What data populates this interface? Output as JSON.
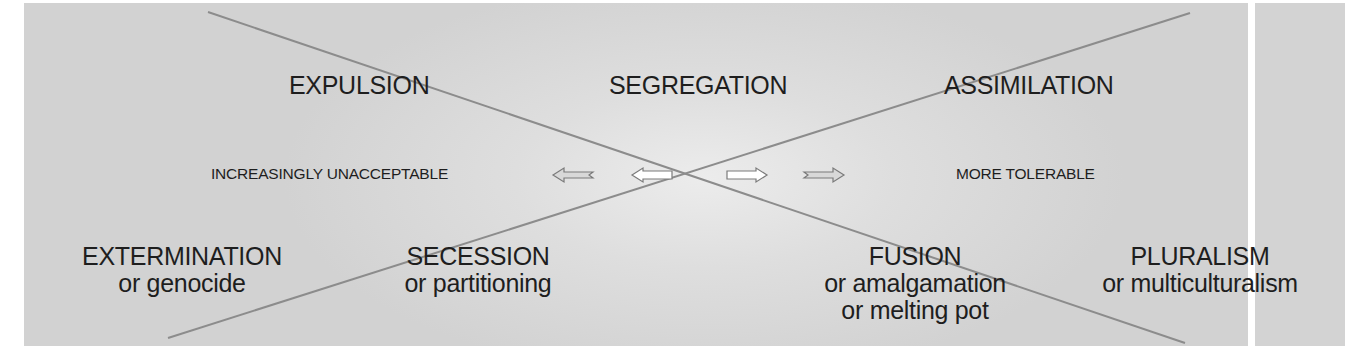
{
  "diagram": {
    "top_row": {
      "expulsion": "EXPULSION",
      "segregation": "SEGREGATION",
      "assimilation": "ASSIMILATION"
    },
    "middle_row": {
      "left_label": "INCREASINGLY UNACCEPTABLE",
      "right_label": "MORE TOLERABLE",
      "arrows": [
        {
          "direction": "left",
          "style": "outline"
        },
        {
          "direction": "left",
          "style": "filled-white"
        },
        {
          "direction": "right",
          "style": "filled-white"
        },
        {
          "direction": "right",
          "style": "outline"
        }
      ]
    },
    "bottom_row": {
      "extermination": {
        "title": "EXTERMINATION",
        "alt1": "or genocide"
      },
      "secession": {
        "title": "SECESSION",
        "alt1": "or partitioning"
      },
      "fusion": {
        "title": "FUSION",
        "alt1": "or amalgamation",
        "alt2": "or melting pot"
      },
      "pluralism": {
        "title": "PLURALISM",
        "alt1": "or multiculturalism"
      }
    },
    "colors": {
      "background": "#d6d6d6",
      "line": "#8a8a8a",
      "text": "#1e1e1e"
    }
  }
}
